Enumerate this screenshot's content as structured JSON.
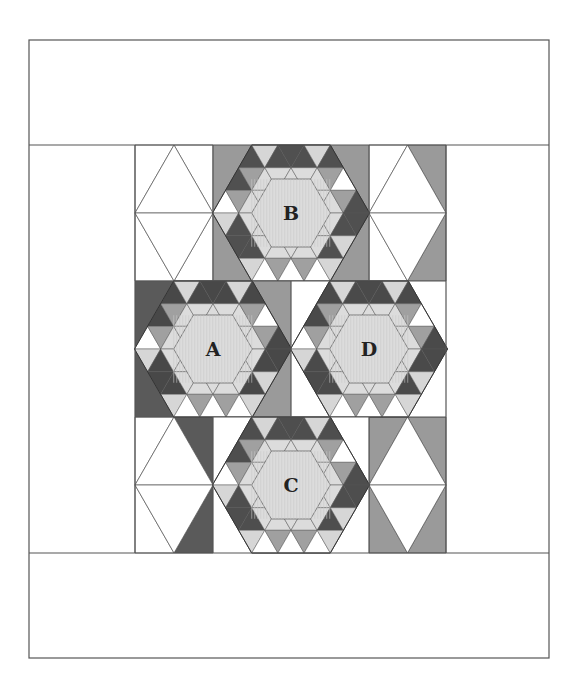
{
  "diagram": {
    "type": "quilt-layout",
    "frame": {
      "x": 29,
      "y": 40,
      "width": 520,
      "height": 618
    },
    "top_border": {
      "y1": 40,
      "y2": 145
    },
    "bottom_border": {
      "y1": 553,
      "y2": 658
    },
    "grid": {
      "x1": 135,
      "x2": 446,
      "rows": [
        145,
        281,
        417,
        553
      ]
    },
    "colors": {
      "outline": "#555555",
      "dark": "#5a5a5a",
      "medium": "#9a9a9a",
      "light": "#d6d6d6",
      "center": "#dcdcdc",
      "white": "#ffffff"
    },
    "blocks": [
      {
        "label": "B",
        "cx": 291,
        "cy": 213,
        "x": 213,
        "y": 145,
        "w": 156,
        "h": 136,
        "bg_left": "#9a9a9a",
        "bg_right": "#9a9a9a",
        "star": "#505050",
        "ring": "#a0a0a0"
      },
      {
        "label": "A",
        "cx": 213,
        "cy": 349,
        "x": 135,
        "y": 281,
        "w": 156,
        "h": 136,
        "bg_left": "#5a5a5a",
        "bg_right": "#9a9a9a",
        "star": "#484848",
        "ring": "#a0a0a0"
      },
      {
        "label": "D",
        "cx": 369,
        "cy": 349,
        "x": 291,
        "y": 281,
        "w": 155,
        "h": 136,
        "bg_left": "#ffffff",
        "bg_right": "#ffffff",
        "star": "#4a4a4a",
        "ring": "#a0a0a0"
      },
      {
        "label": "C",
        "cx": 291,
        "cy": 485,
        "x": 213,
        "y": 417,
        "w": 156,
        "h": 136,
        "bg_left": "#ffffff",
        "bg_right": "#ffffff",
        "star": "#4e4e4e",
        "ring": "#a0a0a0"
      }
    ],
    "diamond_columns": [
      {
        "x": 135,
        "y": 145,
        "w": 78,
        "h": 136,
        "tl": "#ffffff",
        "tr": "#ffffff",
        "bl": "#ffffff",
        "br": "#ffffff"
      },
      {
        "x": 369,
        "y": 145,
        "w": 77,
        "h": 136,
        "tl": "#ffffff",
        "tr": "#9a9a9a",
        "bl": "#ffffff",
        "br": "#9a9a9a"
      },
      {
        "x": 135,
        "y": 417,
        "w": 78,
        "h": 136,
        "tl": "#ffffff",
        "tr": "#5a5a5a",
        "bl": "#ffffff",
        "br": "#5a5a5a"
      },
      {
        "x": 369,
        "y": 417,
        "w": 77,
        "h": 136,
        "tl": "#9a9a9a",
        "tr": "#9a9a9a",
        "bl": "#9a9a9a",
        "br": "#9a9a9a"
      }
    ]
  }
}
